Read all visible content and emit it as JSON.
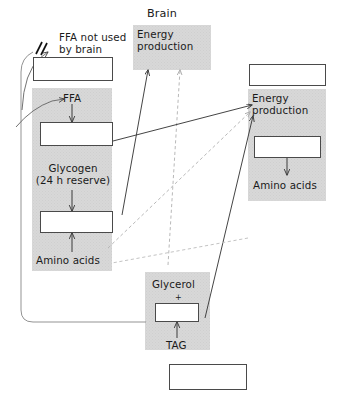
{
  "diagram": {
    "canvas": {
      "width": 340,
      "height": 404,
      "background": "#ffffff"
    },
    "colors": {
      "panel_gray": "#d8d8d8",
      "box_white": "#ffffff",
      "stroke_dark": "#4a4a4a",
      "arrow_solid": "#3a3a3a",
      "arrow_dashed": "#b0b0b0",
      "text": "#1a1a1a"
    }
  },
  "brain": {
    "heading": "Brain",
    "energy_production": "Energy production"
  },
  "left_column": {
    "blocked_note": "FFA not used\nby brain",
    "ffa": "FFA",
    "glycogen": "Glycogen\n(24 h reserve)",
    "amino_acids": "Amino acids",
    "top_box_value": "",
    "mid_box_value": "",
    "lower_box_value": ""
  },
  "right_column": {
    "top_box_value": "",
    "energy_production": "Energy production",
    "inner_box_value": "",
    "amino_acids": "Amino acids"
  },
  "bottom": {
    "glycerol": "Glycerol",
    "plus": "+",
    "tag": "TAG",
    "glycerol_box_value": "",
    "bottom_box_value": ""
  },
  "icons": {
    "blocked_pathway": "blocked-pathway-icon",
    "arrow_head": "arrow-head-icon"
  }
}
